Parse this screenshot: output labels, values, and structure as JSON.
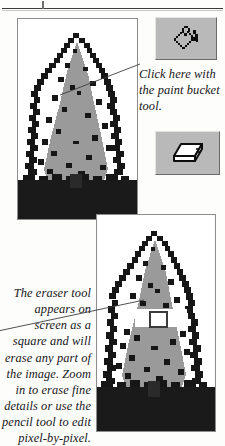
{
  "figure": {
    "background_color": "#fdfdfb"
  },
  "header": {
    "rule_color": "#3a3a3a",
    "tick_color": "#6e6e6e"
  },
  "panels": {
    "top": {
      "name": "tree image before fill",
      "border_color": "#8d8d8d",
      "canvas_color": "#ffffff",
      "foliage_color": "#9a9a9a",
      "outline_color": "#161616",
      "ground_color": "#1a1a1a"
    },
    "bottom": {
      "name": "tree image with erased area",
      "border_color": "#8d8d8d",
      "canvas_color": "#ffffff",
      "foliage_color": "#9a9a9a",
      "outline_color": "#161616",
      "ground_color": "#1a1a1a",
      "erased_region_color": "#ffffff",
      "cursor_outline_color": "#3b3b3b"
    }
  },
  "tools": {
    "bucket": {
      "icon": "paint-bucket-icon",
      "button_face": "#b9b9b9",
      "highlight": "#e4e4e4",
      "shadow": "#6a6a6a"
    },
    "eraser": {
      "icon": "eraser-icon",
      "button_face": "#b9b9b9",
      "highlight": "#e4e4e4",
      "shadow": "#6a6a6a"
    }
  },
  "callouts": {
    "bucket_text": "Click here with the paint bucket tool.",
    "eraser_text": "The eraser tool appears on screen as a square and will erase any part of the image. Zoom in to erase fine details or use the pencil tool to edit pixel-by-pixel.",
    "leader_color": "#3d3d3d"
  }
}
